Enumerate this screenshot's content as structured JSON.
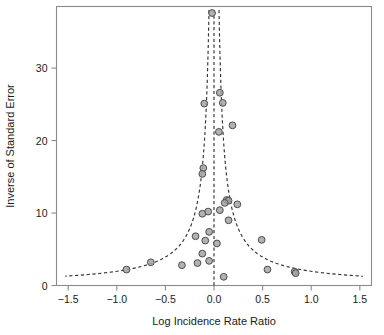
{
  "chart_data": {
    "type": "scatter",
    "title": "",
    "subtitle": "",
    "xlabel": "Log Incidence Rate Ratio",
    "ylabel": "Inverse of Standard Error",
    "xlim": [
      -1.62,
      1.62
    ],
    "ylim": [
      0,
      38.5
    ],
    "xticks": [
      -1.5,
      -1.0,
      -0.5,
      0.0,
      0.5,
      1.0,
      1.5
    ],
    "xtick_labels": [
      "−1.5",
      "−1.0",
      "−0.5",
      "0.0",
      "0.5",
      "1.0",
      "1.5"
    ],
    "yticks": [
      0,
      10,
      20,
      30
    ],
    "ytick_labels": [
      "0",
      "10",
      "20",
      "30"
    ],
    "grid": false,
    "legend": null,
    "annotations": [],
    "series": [
      {
        "name": "Studies",
        "marker": "circle",
        "marker_fill": "#a3a3a3",
        "marker_stroke": "#4d4d4d",
        "points": [
          {
            "x": -0.02,
            "y": 37.6
          },
          {
            "x": 0.06,
            "y": 26.6
          },
          {
            "x": -0.1,
            "y": 25.1
          },
          {
            "x": 0.09,
            "y": 25.2
          },
          {
            "x": 0.19,
            "y": 22.1
          },
          {
            "x": 0.05,
            "y": 21.2
          },
          {
            "x": -0.11,
            "y": 16.2
          },
          {
            "x": -0.12,
            "y": 15.4
          },
          {
            "x": 0.13,
            "y": 11.8
          },
          {
            "x": 0.15,
            "y": 11.7
          },
          {
            "x": 0.11,
            "y": 11.4
          },
          {
            "x": 0.24,
            "y": 11.2
          },
          {
            "x": -0.06,
            "y": 10.2
          },
          {
            "x": -0.12,
            "y": 9.9
          },
          {
            "x": 0.06,
            "y": 10.4
          },
          {
            "x": 0.15,
            "y": 9.0
          },
          {
            "x": -0.19,
            "y": 6.8
          },
          {
            "x": -0.05,
            "y": 7.4
          },
          {
            "x": -0.09,
            "y": 6.2
          },
          {
            "x": 0.03,
            "y": 5.8
          },
          {
            "x": 0.49,
            "y": 6.3
          },
          {
            "x": -0.12,
            "y": 4.4
          },
          {
            "x": -0.17,
            "y": 3.1
          },
          {
            "x": -0.05,
            "y": 3.4
          },
          {
            "x": -0.33,
            "y": 2.8
          },
          {
            "x": -0.65,
            "y": 3.2
          },
          {
            "x": -0.9,
            "y": 2.2
          },
          {
            "x": 0.55,
            "y": 2.2
          },
          {
            "x": 0.83,
            "y": 1.9
          },
          {
            "x": 0.84,
            "y": 1.7
          },
          {
            "x": 0.1,
            "y": 1.2
          }
        ]
      }
    ],
    "reference_line": {
      "type": "vertical",
      "x": 0.0,
      "style": "dashed",
      "color": "#333333"
    },
    "funnel_bounds": {
      "description": "pseudo 95% confidence limits",
      "center": 0.0,
      "z": 1.96,
      "style": "dashed",
      "color": "#333333"
    }
  },
  "chart": {
    "xlabel": "Log Incidence Rate Ratio",
    "ylabel": "Inverse of Standard Error"
  }
}
